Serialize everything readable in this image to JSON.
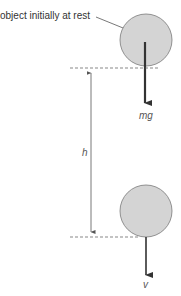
{
  "labels": {
    "object": "object initially at rest",
    "force": "mg",
    "height": "h",
    "velocity": "v"
  },
  "colors": {
    "ball_fill": "#d4d4d4",
    "ball_stroke": "#7a7a7a",
    "arrow": "#333333"
  }
}
